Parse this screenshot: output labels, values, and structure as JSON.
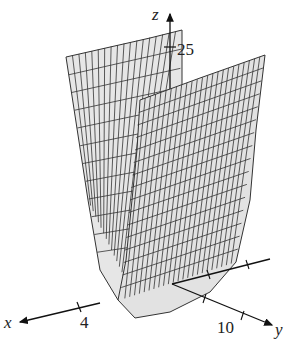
{
  "figure": {
    "type": "3d-surface-plot",
    "surface_fill": "#e4e4e4",
    "mesh_color": "#333333",
    "axis_color": "#111111"
  },
  "axes": {
    "x": {
      "label": "x",
      "tick_label": "4"
    },
    "y": {
      "label": "y",
      "tick_label": "10"
    },
    "z": {
      "label": "z",
      "tick_label": "25"
    }
  }
}
